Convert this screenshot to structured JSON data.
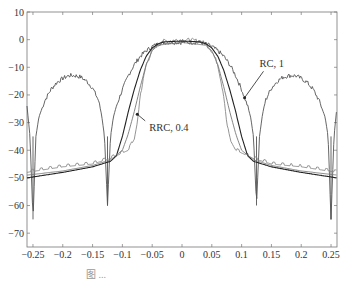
{
  "chart_data": {
    "type": "line",
    "title": "",
    "xlabel": "",
    "ylabel": "",
    "xlim": [
      -0.26,
      0.26
    ],
    "ylim": [
      -75,
      10
    ],
    "xticks": [
      -0.25,
      -0.2,
      -0.15,
      -0.1,
      -0.05,
      0,
      0.05,
      0.1,
      0.15,
      0.2,
      0.25
    ],
    "xtick_labels": [
      "-0.25",
      "-0.2",
      "-0.15",
      "-0.1",
      "-0.05",
      "0",
      "0.05",
      "0.1",
      "0.15",
      "0.2",
      "0.25"
    ],
    "yticks": [
      10,
      0,
      -10,
      -20,
      -30,
      -40,
      -50,
      -60,
      -70
    ],
    "ytick_labels": [
      "10",
      "0",
      "-10",
      "-20",
      "-30",
      "-40",
      "-50",
      "-60",
      "-70"
    ],
    "grid": false,
    "legend": "none",
    "annotations": [
      {
        "text": "RC, 1",
        "x": 0.13,
        "y": -10,
        "arrow_to": [
          0.105,
          -21
        ]
      },
      {
        "text": "RRC, 0.4",
        "x": -0.055,
        "y": -33,
        "arrow_to": [
          -0.075,
          -27
        ]
      }
    ],
    "series": [
      {
        "name": "RC, 1 (with sidelobe bumps)",
        "color": "#555555",
        "x": [
          -0.26,
          -0.255,
          -0.25,
          -0.245,
          -0.24,
          -0.23,
          -0.22,
          -0.21,
          -0.2,
          -0.19,
          -0.18,
          -0.17,
          -0.16,
          -0.15,
          -0.14,
          -0.135,
          -0.13,
          -0.125,
          -0.12,
          -0.115,
          -0.11,
          -0.1,
          -0.09,
          -0.08,
          -0.07,
          -0.06,
          -0.05,
          -0.04,
          -0.03,
          -0.02,
          0,
          0.02,
          0.03,
          0.04,
          0.05,
          0.06,
          0.07,
          0.08,
          0.09,
          0.1,
          0.11,
          0.115,
          0.12,
          0.125,
          0.13,
          0.135,
          0.14,
          0.15,
          0.16,
          0.17,
          0.18,
          0.19,
          0.2,
          0.21,
          0.22,
          0.23,
          0.24,
          0.245,
          0.25,
          0.255,
          0.26
        ],
        "y": [
          -24,
          -35,
          -65,
          -35,
          -28,
          -22,
          -18,
          -15.5,
          -14,
          -13,
          -13,
          -13.5,
          -15,
          -17.5,
          -22,
          -27,
          -35,
          -60,
          -35,
          -28,
          -24,
          -18,
          -13,
          -9,
          -6,
          -4,
          -2.5,
          -1.5,
          -1,
          -1,
          -1,
          -1,
          -1,
          -1.5,
          -2.5,
          -4,
          -6,
          -9,
          -13,
          -18,
          -24,
          -28,
          -35,
          -60,
          -35,
          -27,
          -22,
          -17.5,
          -15,
          -13.5,
          -13,
          -13,
          -14,
          -15.5,
          -18,
          -22,
          -28,
          -35,
          -65,
          -35,
          -24
        ]
      },
      {
        "name": "RRC, 0.4",
        "color": "#888888",
        "x": [
          -0.26,
          -0.2,
          -0.15,
          -0.12,
          -0.1,
          -0.09,
          -0.085,
          -0.08,
          -0.075,
          -0.07,
          -0.06,
          -0.05,
          -0.04,
          -0.03,
          0,
          0.03,
          0.04,
          0.05,
          0.06,
          0.07,
          0.075,
          0.08,
          0.085,
          0.09,
          0.1,
          0.12,
          0.15,
          0.2,
          0.26
        ],
        "y": [
          -48,
          -46,
          -45,
          -43,
          -41,
          -40,
          -38,
          -36,
          -30,
          -20,
          -9,
          -4,
          -1.5,
          -0.5,
          0,
          -0.5,
          -1.5,
          -4,
          -9,
          -20,
          -30,
          -36,
          -38,
          -40,
          -41,
          -43,
          -45,
          -46,
          -48
        ]
      },
      {
        "name": "RC, 1 smooth",
        "color": "#222222",
        "x": [
          -0.26,
          -0.2,
          -0.15,
          -0.12,
          -0.11,
          -0.1,
          -0.09,
          -0.08,
          -0.07,
          -0.06,
          -0.05,
          -0.04,
          -0.03,
          0,
          0.03,
          0.04,
          0.05,
          0.06,
          0.07,
          0.08,
          0.09,
          0.1,
          0.11,
          0.12,
          0.15,
          0.2,
          0.26
        ],
        "y": [
          -50,
          -48,
          -46,
          -44,
          -42,
          -35,
          -26,
          -18,
          -11,
          -6,
          -3,
          -1.5,
          -0.8,
          -0.5,
          -0.8,
          -1.5,
          -3,
          -6,
          -11,
          -18,
          -26,
          -35,
          -42,
          -44,
          -46,
          -48,
          -50
        ]
      },
      {
        "name": "lower envelope",
        "color": "#777777",
        "x": [
          -0.26,
          -0.2,
          -0.15,
          -0.12,
          -0.1,
          -0.09,
          -0.08,
          -0.07,
          -0.06,
          -0.05,
          -0.04,
          0,
          0.04,
          0.05,
          0.06,
          0.07,
          0.08,
          0.09,
          0.1,
          0.12,
          0.15,
          0.2,
          0.26
        ],
        "y": [
          -49,
          -47.5,
          -45.5,
          -43.5,
          -40,
          -34,
          -26,
          -17,
          -9,
          -4,
          -2,
          -1,
          -2,
          -4,
          -9,
          -17,
          -26,
          -34,
          -40,
          -43.5,
          -45.5,
          -47.5,
          -49
        ]
      }
    ]
  },
  "caption": {
    "text": "图 ..."
  }
}
